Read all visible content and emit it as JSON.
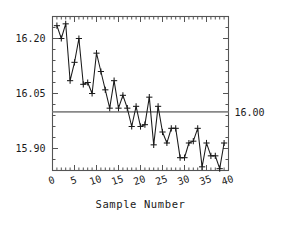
{
  "chart_data": {
    "type": "line",
    "title": "",
    "subtitle": "",
    "xlabel": "Sample Number",
    "ylabel": "",
    "xlim": [
      0,
      40
    ],
    "ylim": [
      15.84,
      16.26
    ],
    "grid": false,
    "legend": null,
    "marker": "plus",
    "x": [
      1,
      2,
      3,
      4,
      5,
      6,
      7,
      8,
      9,
      10,
      11,
      12,
      13,
      14,
      15,
      16,
      17,
      18,
      19,
      20,
      21,
      22,
      23,
      24,
      25,
      26,
      27,
      28,
      29,
      30,
      31,
      32,
      33,
      34,
      35,
      36,
      37,
      38,
      39
    ],
    "values": [
      16.235,
      16.2,
      16.24,
      16.085,
      16.135,
      16.2,
      16.075,
      16.08,
      16.05,
      16.16,
      16.11,
      16.06,
      16.01,
      16.085,
      16.01,
      16.045,
      16.01,
      15.96,
      16.015,
      15.96,
      15.965,
      16.04,
      15.91,
      16.015,
      15.945,
      15.915,
      15.955,
      15.955,
      15.875,
      15.875,
      15.915,
      15.92,
      15.955,
      15.85,
      15.915,
      15.88,
      15.88,
      15.845,
      15.915
    ],
    "series": [
      {
        "name": "Sample Measurement",
        "values": [
          16.235,
          16.2,
          16.24,
          16.085,
          16.135,
          16.2,
          16.075,
          16.08,
          16.05,
          16.16,
          16.11,
          16.06,
          16.01,
          16.085,
          16.01,
          16.045,
          16.01,
          15.96,
          16.015,
          15.96,
          15.965,
          16.04,
          15.91,
          16.015,
          15.945,
          15.915,
          15.955,
          15.955,
          15.875,
          15.875,
          15.915,
          15.92,
          15.955,
          15.85,
          15.915,
          15.88,
          15.88,
          15.845,
          15.915
        ]
      }
    ],
    "reference_line": {
      "value": 16.0,
      "label": "16.00",
      "color": "#888888"
    },
    "xticks": [
      0,
      5,
      10,
      15,
      20,
      25,
      30,
      35,
      40
    ],
    "xtick_labels": [
      "0",
      "5",
      "10",
      "15",
      "20",
      "25",
      "30",
      "35",
      "40"
    ],
    "yticks": [
      15.9,
      16.05,
      16.2
    ],
    "ytick_labels": [
      "15.90",
      "16.05",
      "16.20"
    ],
    "line_color": "#1a1a1a",
    "frame_color": "#555555"
  },
  "axes": {
    "x_title": "Sample Number",
    "y_tick_labels": [
      "16.20",
      "16.05",
      "15.90"
    ],
    "x_tick_labels": [
      "0",
      "5",
      "10",
      "15",
      "20",
      "25",
      "30",
      "35",
      "40"
    ],
    "reference_label": "16.00"
  }
}
